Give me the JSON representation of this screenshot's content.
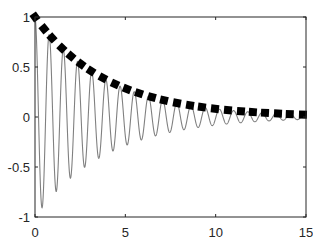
{
  "chart_data": {
    "type": "line",
    "title": "",
    "xlabel": "",
    "ylabel": "",
    "xlim": [
      0,
      15
    ],
    "ylim": [
      -1,
      1
    ],
    "grid": false,
    "legend": null,
    "x_ticks": [
      0,
      5,
      10,
      15
    ],
    "x_tick_labels": [
      "0",
      "5",
      "10",
      "15"
    ],
    "y_ticks": [
      -1,
      -0.5,
      0,
      0.5,
      1
    ],
    "y_tick_labels": [
      "-1",
      "-0.5",
      "0",
      "0.5",
      "1"
    ],
    "series": [
      {
        "name": "damped oscillation",
        "style": "line",
        "color": "#808080",
        "formula": "exp(-0.25x)*cos(8x)",
        "decay_rate": 0.25,
        "angular_frequency": 8,
        "x_range": [
          0,
          15
        ]
      },
      {
        "name": "envelope",
        "style": "markers",
        "marker_shape": "square (rotated near start)",
        "color": "#000000",
        "formula": "exp(-0.25x)",
        "x": [
          0,
          0.5,
          0.94,
          1.49,
          1.99,
          2.55,
          3.1,
          3.76,
          4.43,
          5.09,
          5.76,
          6.47,
          7.14,
          7.86,
          8.58,
          9.24,
          9.96,
          10.68,
          11.4,
          12.06,
          12.73,
          13.45,
          14.1,
          14.83
        ],
        "y": [
          1.0,
          0.88,
          0.79,
          0.69,
          0.61,
          0.53,
          0.46,
          0.39,
          0.33,
          0.28,
          0.24,
          0.2,
          0.17,
          0.14,
          0.12,
          0.1,
          0.08,
          0.07,
          0.06,
          0.05,
          0.04,
          0.035,
          0.03,
          0.025
        ]
      }
    ]
  }
}
